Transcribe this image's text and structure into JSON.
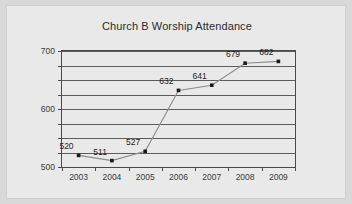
{
  "chart_data": {
    "type": "line",
    "title": "Church B Worship Attendance",
    "xlabel": "",
    "ylabel": "",
    "categories": [
      "2003",
      "2004",
      "2005",
      "2006",
      "2007",
      "2008",
      "2009"
    ],
    "values": [
      520,
      511,
      527,
      632,
      641,
      679,
      682
    ],
    "data_labels": [
      "520",
      "511",
      "527",
      "632",
      "641",
      "679",
      "682"
    ],
    "ylim": [
      500,
      700
    ],
    "ymajor_ticks": [
      500,
      600,
      700
    ],
    "ymajor_tick_labels": [
      "500",
      "600",
      "700"
    ],
    "ygridlines": [
      500,
      525,
      550,
      575,
      600,
      625,
      650,
      675,
      700
    ],
    "grid": true,
    "legend": false,
    "legend_position": "none",
    "series": [
      {
        "name": "Attendance",
        "values": [
          520,
          511,
          527,
          632,
          641,
          679,
          682
        ]
      }
    ],
    "colors": {
      "figure_background": "#e9e9e9",
      "page_background": "#d9d9d9",
      "plot_border": "#4a4a4a",
      "gridline": "#5c5c5c",
      "line": "#8c8c8c",
      "marker": "#1a1a1a",
      "title_text": "#2b2b2b",
      "tick_text": "#3a3a3a",
      "label_text": "#1d1d1d"
    }
  }
}
